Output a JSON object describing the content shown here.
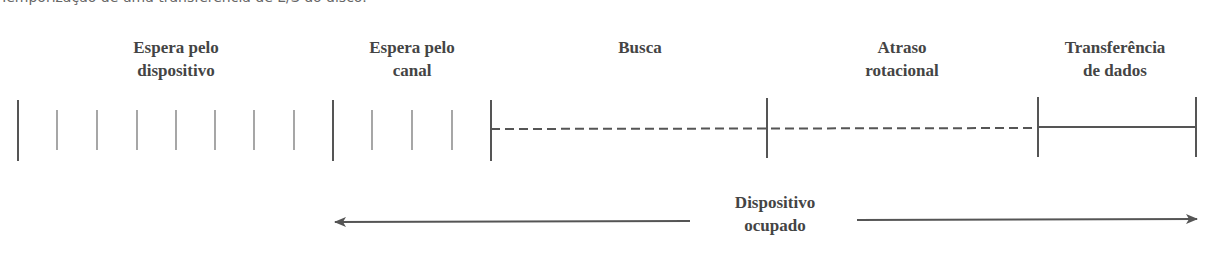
{
  "caption": "Temporização de uma transferência de E/S do disco.",
  "phases": [
    {
      "id": "device-wait",
      "line1": "Espera pelo",
      "line2": "dispositivo",
      "center_x": 176
    },
    {
      "id": "channel-wait",
      "line1": "Espera pelo",
      "line2": "canal",
      "center_x": 412
    },
    {
      "id": "seek",
      "line1": "Busca",
      "line2": "",
      "center_x": 640
    },
    {
      "id": "rotational-delay",
      "line1": "Atraso",
      "line2": "rotacional",
      "center_x": 902
    },
    {
      "id": "data-transfer",
      "line1": "Transferência",
      "line2": "de dados",
      "center_x": 1115
    }
  ],
  "busy": {
    "line1": "Dispositivo",
    "line2": "ocupado"
  },
  "colors": {
    "line": "#555555",
    "text": "#444444",
    "tick": "#777777"
  }
}
